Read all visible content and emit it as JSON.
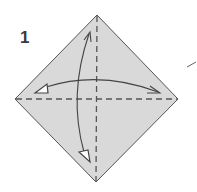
{
  "diagram": {
    "type": "origami-step",
    "step_number": "1",
    "paper": {
      "shape": "square-rotated-diamond",
      "fill": "#d9d9d9",
      "edge_color": "#555555",
      "vertices": {
        "top": [
          97,
          15
        ],
        "left": [
          15,
          99
        ],
        "right": [
          178,
          99
        ],
        "bottom": [
          96,
          182
        ]
      }
    },
    "fold_lines": [
      {
        "name": "vertical-valley-fold",
        "style": "dashed",
        "from": [
          97,
          15
        ],
        "to": [
          96,
          182
        ]
      },
      {
        "name": "horizontal-valley-fold",
        "style": "dashed",
        "from": [
          15,
          99
        ],
        "to": [
          178,
          99
        ]
      }
    ],
    "arrows": [
      {
        "name": "fold-unfold-horizontal",
        "kind": "double-ended",
        "from": [
          40,
          91
        ],
        "to": [
          160,
          92
        ]
      },
      {
        "name": "fold-unfold-vertical",
        "kind": "double-ended",
        "from": [
          90,
          32
        ],
        "to": [
          85,
          160
        ]
      }
    ],
    "stroke_color": "#4a4a4a"
  }
}
